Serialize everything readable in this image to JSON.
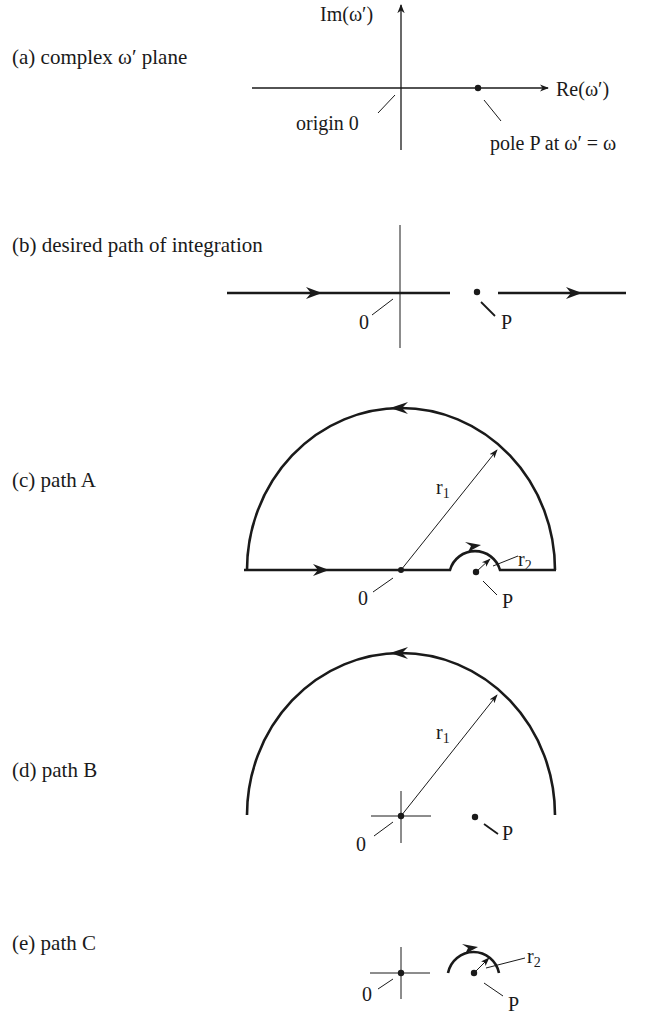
{
  "figure": {
    "panels": [
      {
        "id": "a",
        "caption": "(a)  complex ω′ plane",
        "axis_y_label": "Im(ω′)",
        "axis_x_label": "Re(ω′)",
        "origin_label": "origin 0",
        "pole_label": "pole P at ω′ = ω"
      },
      {
        "id": "b",
        "caption": "(b)  desired path of integration",
        "origin_label": "0",
        "pole_label": "P"
      },
      {
        "id": "c",
        "caption": "(c)  path A",
        "origin_label": "0",
        "pole_label": "P",
        "radius_large": "r",
        "radius_large_sub": "1",
        "radius_small": "r",
        "radius_small_sub": "2"
      },
      {
        "id": "d",
        "caption": "(d)  path B",
        "origin_label": "0",
        "pole_label": "P",
        "radius_large": "r",
        "radius_large_sub": "1"
      },
      {
        "id": "e",
        "caption": "(e)  path C",
        "origin_label": "0",
        "pole_label": "P",
        "radius_small": "r",
        "radius_small_sub": "2"
      }
    ],
    "colors": {
      "ink": "#1a1a1a",
      "background": "#ffffff"
    }
  }
}
